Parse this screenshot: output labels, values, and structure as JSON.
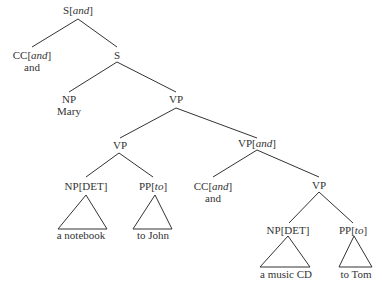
{
  "tree": {
    "root": {
      "cat": "S",
      "feat": "and"
    },
    "nodes": [
      {
        "id": "n1",
        "cat": "S",
        "feat": "and",
        "word": ""
      },
      {
        "id": "n2",
        "cat": "CC",
        "feat": "and",
        "word": "and"
      },
      {
        "id": "n3",
        "cat": "S",
        "feat": "",
        "word": ""
      },
      {
        "id": "n4",
        "cat": "NP",
        "feat": "",
        "word": "Mary"
      },
      {
        "id": "n5",
        "cat": "VP",
        "feat": "",
        "word": ""
      },
      {
        "id": "n6",
        "cat": "VP",
        "feat": "",
        "word": ""
      },
      {
        "id": "n7",
        "cat": "VP",
        "feat": "and",
        "word": ""
      },
      {
        "id": "n8",
        "cat": "NP",
        "feat": "DET",
        "word": "a notebook"
      },
      {
        "id": "n9",
        "cat": "PP",
        "feat": "to",
        "word": "to John"
      },
      {
        "id": "n10",
        "cat": "CC",
        "feat": "and",
        "word": "and"
      },
      {
        "id": "n11",
        "cat": "VP",
        "feat": "",
        "word": ""
      },
      {
        "id": "n12",
        "cat": "NP",
        "feat": "DET",
        "word": "a music CD"
      },
      {
        "id": "n13",
        "cat": "PP",
        "feat": "to",
        "word": "to Tom"
      }
    ]
  },
  "labels": {
    "s_and": {
      "cat": "S",
      "feat": "and"
    },
    "cc1": {
      "cat": "CC",
      "feat": "and",
      "word": "and"
    },
    "s": "S",
    "np_mary": {
      "cat": "NP",
      "word": "Mary"
    },
    "vp_top": "VP",
    "vp_left": "VP",
    "vp_and": {
      "cat": "VP",
      "feat": "and"
    },
    "np_det1": {
      "cat": "NP[DET]",
      "word": "a notebook"
    },
    "pp_to1": {
      "cat": "PP",
      "feat": "to",
      "word": "to John"
    },
    "cc2": {
      "cat": "CC",
      "feat": "and",
      "word": "and"
    },
    "vp_right": "VP",
    "np_det2": {
      "cat": "NP[DET]",
      "word": "a music CD"
    },
    "pp_to2": {
      "cat": "PP",
      "feat": "to",
      "word": "to Tom"
    }
  }
}
